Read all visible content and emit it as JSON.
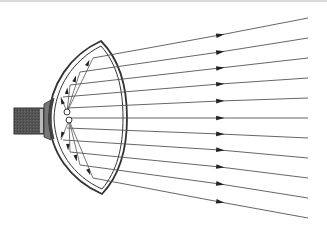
{
  "diagram": {
    "title": "Parabolic reflector producing parallel rays",
    "colors": {
      "background": "#ffffff",
      "ray": "#555555",
      "outline": "#333333",
      "arrow": "#222222",
      "lamp_body": "#555555",
      "lamp_stripe": "#bbbbbb",
      "collar": "#777777"
    },
    "focus_points": [
      {
        "x": 67,
        "y": 112
      },
      {
        "x": 69,
        "y": 120
      }
    ],
    "lens_outline": {
      "top_tip": {
        "x": 101,
        "y": 43
      },
      "bottom_tip": {
        "x": 102,
        "y": 192
      },
      "left_edge_x": 52,
      "right_edge_x": 125
    },
    "rays": [
      {
        "start": {
          "x": 93,
          "y": 58
        },
        "arrow": {
          "x": 220,
          "y": 35
        },
        "end": {
          "x": 308,
          "y": 18
        }
      },
      {
        "start": {
          "x": 80,
          "y": 72
        },
        "arrow": {
          "x": 220,
          "y": 52
        },
        "end": {
          "x": 308,
          "y": 38
        }
      },
      {
        "start": {
          "x": 70,
          "y": 85
        },
        "arrow": {
          "x": 220,
          "y": 68
        },
        "end": {
          "x": 308,
          "y": 58
        }
      },
      {
        "start": {
          "x": 63,
          "y": 97
        },
        "arrow": {
          "x": 220,
          "y": 84
        },
        "end": {
          "x": 308,
          "y": 78
        }
      },
      {
        "start": {
          "x": 67,
          "y": 108
        },
        "arrow": {
          "x": 220,
          "y": 101
        },
        "end": {
          "x": 308,
          "y": 98
        }
      },
      {
        "start": {
          "x": 70,
          "y": 118
        },
        "arrow": {
          "x": 220,
          "y": 118
        },
        "end": {
          "x": 308,
          "y": 118
        }
      },
      {
        "start": {
          "x": 67,
          "y": 128
        },
        "arrow": {
          "x": 220,
          "y": 134
        },
        "end": {
          "x": 308,
          "y": 138
        }
      },
      {
        "start": {
          "x": 63,
          "y": 140
        },
        "arrow": {
          "x": 220,
          "y": 150
        },
        "end": {
          "x": 308,
          "y": 158
        }
      },
      {
        "start": {
          "x": 70,
          "y": 152
        },
        "arrow": {
          "x": 220,
          "y": 167
        },
        "end": {
          "x": 308,
          "y": 178
        }
      },
      {
        "start": {
          "x": 80,
          "y": 165
        },
        "arrow": {
          "x": 220,
          "y": 184
        },
        "end": {
          "x": 308,
          "y": 198
        }
      },
      {
        "start": {
          "x": 93,
          "y": 178
        },
        "arrow": {
          "x": 220,
          "y": 202
        },
        "end": {
          "x": 308,
          "y": 218
        }
      }
    ],
    "internal_rays": [
      {
        "from": {
          "x": 67,
          "y": 112
        },
        "to": {
          "x": 93,
          "y": 58
        },
        "arrow": {
          "x": 88,
          "y": 63
        }
      },
      {
        "from": {
          "x": 67,
          "y": 112
        },
        "to": {
          "x": 80,
          "y": 72
        },
        "arrow": {
          "x": 75,
          "y": 79
        }
      },
      {
        "from": {
          "x": 67,
          "y": 112
        },
        "to": {
          "x": 70,
          "y": 85
        },
        "arrow": {
          "x": 67,
          "y": 91
        }
      },
      {
        "from": {
          "x": 67,
          "y": 112
        },
        "to": {
          "x": 61,
          "y": 97
        },
        "arrow": {
          "x": 62,
          "y": 101
        }
      },
      {
        "from": {
          "x": 69,
          "y": 120
        },
        "to": {
          "x": 61,
          "y": 140
        },
        "arrow": {
          "x": 62,
          "y": 135
        }
      },
      {
        "from": {
          "x": 69,
          "y": 120
        },
        "to": {
          "x": 70,
          "y": 152
        },
        "arrow": {
          "x": 68,
          "y": 147
        }
      },
      {
        "from": {
          "x": 69,
          "y": 120
        },
        "to": {
          "x": 80,
          "y": 165
        },
        "arrow": {
          "x": 76,
          "y": 158
        }
      },
      {
        "from": {
          "x": 69,
          "y": 120
        },
        "to": {
          "x": 93,
          "y": 178
        },
        "arrow": {
          "x": 89,
          "y": 172
        }
      }
    ]
  }
}
